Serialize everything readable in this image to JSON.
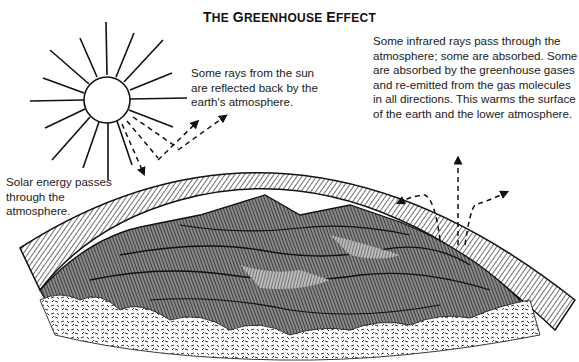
{
  "title": {
    "text": "The Greenhouse Effect",
    "smallcaps_parts": [
      {
        "big": "T",
        "small": "HE "
      },
      {
        "big": "G",
        "small": "REENHOUSE "
      },
      {
        "big": "E",
        "small": "FFECT"
      }
    ]
  },
  "annotations": {
    "reflected": {
      "lines": [
        "Some rays from the sun",
        "are reflected back by the",
        "earth's atmosphere."
      ]
    },
    "infrared": {
      "lines": [
        "Some infrared rays pass through the",
        "atmosphere; some are absorbed. Some",
        "are absorbed by the greenhouse gases",
        "and re-emitted from the gas molecules",
        "in all directions. This warms the surface",
        "of the earth and the lower atmosphere."
      ]
    },
    "solar": {
      "lines": [
        "Solar energy passes",
        "through the",
        "atmosphere."
      ]
    }
  },
  "elements": {
    "sun": "sun-icon",
    "atmosphere": "atmosphere-band",
    "earth": "earth-surface",
    "incoming_rays": "solar-ray-arrows",
    "reflected_rays": "reflected-ray-arrows",
    "infrared_rays": "infrared-ray-arrows"
  },
  "colors": {
    "ink": "#111111",
    "background": "#ffffff"
  }
}
